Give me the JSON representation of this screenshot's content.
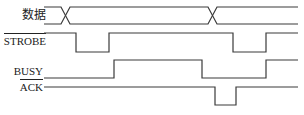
{
  "diagram": {
    "type": "timing-diagram",
    "colors": {
      "line": "#3a3a3a",
      "text": "#222222",
      "background": "#ffffff"
    },
    "signals": [
      {
        "name": "数据",
        "active_low": false,
        "kind": "bus"
      },
      {
        "name": "STROBE",
        "active_low": true,
        "kind": "digital"
      },
      {
        "name": "BUSY",
        "active_low": false,
        "kind": "digital"
      },
      {
        "name": "ACK",
        "active_low": true,
        "kind": "digital"
      }
    ]
  }
}
